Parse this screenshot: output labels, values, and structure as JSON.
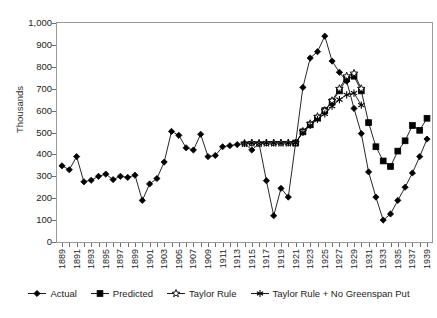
{
  "chart_data": {
    "type": "line",
    "title": "",
    "xlabel": "",
    "ylabel": "Thousands",
    "ylim": [
      0,
      1000
    ],
    "yticks": [
      "0",
      "100",
      "200",
      "300",
      "400",
      "500",
      "600",
      "700",
      "800",
      "900",
      "1,000"
    ],
    "ytick_values": [
      0,
      100,
      200,
      300,
      400,
      500,
      600,
      700,
      800,
      900,
      1000
    ],
    "grid": false,
    "legend_position": "bottom",
    "xlim": [
      1889,
      1939
    ],
    "x": [
      1889,
      1890,
      1891,
      1892,
      1893,
      1894,
      1895,
      1896,
      1897,
      1898,
      1899,
      1900,
      1901,
      1902,
      1903,
      1904,
      1905,
      1906,
      1907,
      1908,
      1909,
      1910,
      1911,
      1912,
      1913,
      1914,
      1915,
      1916,
      1917,
      1918,
      1919,
      1920,
      1921,
      1922,
      1923,
      1924,
      1925,
      1926,
      1927,
      1928,
      1929,
      1930,
      1931,
      1932,
      1933,
      1934,
      1935,
      1936,
      1937,
      1938,
      1939
    ],
    "xtick_labels": [
      "1889",
      "1891",
      "1893",
      "1895",
      "1897",
      "1899",
      "1901",
      "1903",
      "1905",
      "1907",
      "1909",
      "1911",
      "1913",
      "1915",
      "1917",
      "1919",
      "1921",
      "1923",
      "1925",
      "1927",
      "1929",
      "1931",
      "1933",
      "1935",
      "1937",
      "1939"
    ],
    "xtick_values": [
      1889,
      1891,
      1893,
      1895,
      1897,
      1899,
      1901,
      1903,
      1905,
      1907,
      1909,
      1911,
      1913,
      1915,
      1917,
      1919,
      1921,
      1923,
      1925,
      1927,
      1929,
      1931,
      1933,
      1935,
      1937,
      1939
    ],
    "series": [
      {
        "name": "Actual",
        "marker": "diamond",
        "x": [
          1889,
          1890,
          1891,
          1892,
          1893,
          1894,
          1895,
          1896,
          1897,
          1898,
          1899,
          1900,
          1901,
          1902,
          1903,
          1904,
          1905,
          1906,
          1907,
          1908,
          1909,
          1910,
          1911,
          1912,
          1913,
          1914,
          1915,
          1916,
          1917,
          1918,
          1919,
          1920,
          1921,
          1922,
          1923,
          1924,
          1925,
          1926,
          1927,
          1928,
          1929,
          1930,
          1931,
          1932,
          1933,
          1934,
          1935,
          1936,
          1937,
          1938,
          1939
        ],
        "values": [
          348,
          330,
          390,
          275,
          282,
          300,
          310,
          285,
          300,
          295,
          305,
          190,
          265,
          290,
          365,
          505,
          487,
          430,
          420,
          492,
          390,
          395,
          435,
          440,
          445,
          450,
          420,
          450,
          280,
          120,
          245,
          205,
          452,
          706,
          840,
          869,
          940,
          826,
          775,
          734,
          610,
          495,
          320,
          205,
          100,
          128,
          190,
          250,
          315,
          390,
          470
        ]
      },
      {
        "name": "Predicted",
        "marker": "square",
        "x": [
          1921,
          1922,
          1923,
          1924,
          1925,
          1926,
          1927,
          1928,
          1929,
          1930,
          1931,
          1932,
          1933,
          1934,
          1935,
          1936,
          1937,
          1938,
          1939
        ],
        "values": [
          452,
          503,
          535,
          566,
          600,
          640,
          690,
          745,
          757,
          690,
          545,
          435,
          370,
          345,
          415,
          462,
          532,
          510,
          565
        ]
      },
      {
        "name": "Taylor Rule",
        "marker": "open-star",
        "x": [
          1914,
          1915,
          1916,
          1917,
          1918,
          1919,
          1920,
          1921,
          1922,
          1923,
          1924,
          1925,
          1926,
          1927,
          1928,
          1929,
          1930
        ],
        "values": [
          450,
          452,
          450,
          452,
          452,
          452,
          452,
          452,
          505,
          540,
          572,
          600,
          645,
          700,
          757,
          770,
          700
        ]
      },
      {
        "name": "Taylor Rule + No Greenspan Put",
        "marker": "asterisk",
        "x": [
          1914,
          1915,
          1916,
          1917,
          1918,
          1919,
          1920,
          1921,
          1922,
          1923,
          1924,
          1925,
          1926,
          1927,
          1928,
          1929,
          1930
        ],
        "values": [
          450,
          452,
          450,
          452,
          452,
          452,
          452,
          452,
          500,
          532,
          560,
          585,
          620,
          650,
          672,
          680,
          625
        ]
      }
    ]
  },
  "legend": {
    "items": [
      {
        "label": "Actual",
        "marker": "diamond"
      },
      {
        "label": "Predicted",
        "marker": "square"
      },
      {
        "label": "Taylor Rule",
        "marker": "open-star"
      },
      {
        "label": "Taylor Rule + No Greenspan Put",
        "marker": "asterisk"
      }
    ]
  },
  "colors": {
    "line": "#000000",
    "frame": "#9a9a9a",
    "text": "#1d1d1d",
    "background": "#ffffff"
  }
}
